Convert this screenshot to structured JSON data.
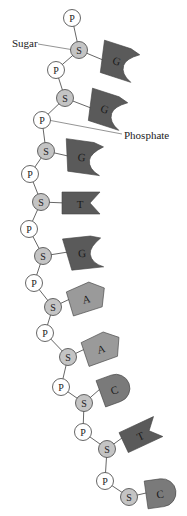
{
  "diagram": {
    "colors": {
      "phosphate_fill": "#ffffff",
      "sugar_fill": "#c4c4c4",
      "node_stroke": "#555555",
      "purine_dark": "#5a5a5a",
      "adenine": "#9a9a9a",
      "cytosine": "#7a7a7a",
      "thymine": "#5a5a5a"
    },
    "labels": {
      "sugar": {
        "text": "Sugar",
        "x": 12,
        "y": 47,
        "line": [
          38,
          44,
          74,
          50
        ]
      },
      "phosphate": {
        "text": "Phosphate",
        "x": 124,
        "y": 139,
        "line": [
          48,
          120,
          122,
          134
        ]
      }
    },
    "phosphate_symbol": "P",
    "sugar_symbol": "S",
    "nucleotides": [
      {
        "p": [
          72,
          18
        ],
        "s": [
          79,
          50
        ],
        "base": "G",
        "shape": "g",
        "bx": 117,
        "by": 60,
        "rot": 18
      },
      {
        "p": [
          56,
          70
        ],
        "s": [
          65,
          98
        ],
        "base": "G",
        "shape": "g",
        "bx": 105,
        "by": 108,
        "rot": 18
      },
      {
        "p": [
          42,
          120
        ],
        "s": [
          46,
          151
        ],
        "base": "G",
        "shape": "g",
        "bx": 82,
        "by": 156,
        "rot": 8
      },
      {
        "p": [
          30,
          174
        ],
        "s": [
          41,
          202
        ],
        "base": "T",
        "shape": "t",
        "bx": 80,
        "by": 203,
        "rot": 0
      },
      {
        "p": [
          29,
          229
        ],
        "s": [
          43,
          256
        ],
        "base": "G",
        "shape": "g",
        "bx": 82,
        "by": 252,
        "rot": -6
      },
      {
        "p": [
          34,
          283
        ],
        "s": [
          53,
          307
        ],
        "base": "A",
        "shape": "a",
        "bx": 86,
        "by": 298,
        "rot": -12
      },
      {
        "p": [
          45,
          333
        ],
        "s": [
          68,
          357
        ],
        "base": "A",
        "shape": "a",
        "bx": 101,
        "by": 348,
        "rot": -14
      },
      {
        "p": [
          61,
          387
        ],
        "s": [
          84,
          403
        ],
        "base": "C",
        "shape": "c",
        "bx": 114,
        "by": 389,
        "rot": -20
      },
      {
        "p": [
          83,
          432
        ],
        "s": [
          107,
          449
        ],
        "base": "T",
        "shape": "t",
        "bx": 140,
        "by": 435,
        "rot": -25
      },
      {
        "p": [
          105,
          481
        ],
        "s": [
          129,
          497
        ],
        "base": "C",
        "shape": "c",
        "bx": 160,
        "by": 493,
        "rot": -8
      }
    ]
  }
}
